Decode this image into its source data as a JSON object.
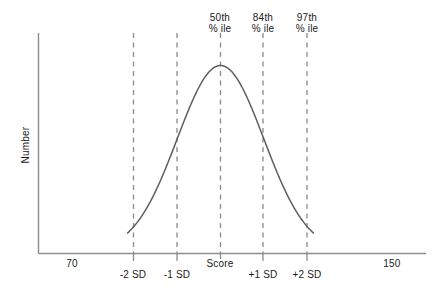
{
  "chart_data": {
    "type": "line",
    "title": "",
    "subtitle": "",
    "xlabel": "Score",
    "ylabel": "Number",
    "grid": false,
    "legend": null,
    "xlim": [
      70,
      150
    ],
    "ylim": [
      0,
      1
    ],
    "x_tick_labels": [
      "70",
      "150"
    ],
    "x_tick_values": [
      70,
      150
    ],
    "mean": 110,
    "sd": 20,
    "curve": {
      "name": "Normal distribution",
      "x": [
        70,
        74,
        78,
        82,
        86,
        90,
        94,
        98,
        102,
        106,
        110,
        114,
        118,
        122,
        126,
        130,
        134,
        138,
        142,
        146,
        150
      ],
      "y": [
        0.0111,
        0.0235,
        0.0458,
        0.0821,
        0.1353,
        0.2054,
        0.2865,
        0.3679,
        0.4868,
        0.6065,
        1.0,
        0.9231,
        0.8007,
        0.6376,
        0.4868,
        0.3247,
        0.2096,
        0.1353,
        0.0796,
        0.0388,
        0.0111
      ]
    },
    "reference_lines": [
      {
        "id": "minus-2-sd",
        "score": 90,
        "sd_label": "-2 SD",
        "percentile_label": null,
        "style": "dashed"
      },
      {
        "id": "minus-1-sd",
        "score": 100,
        "sd_label": "-1 SD",
        "percentile_label": null,
        "style": "dashed"
      },
      {
        "id": "mean",
        "score": 110,
        "sd_label": null,
        "percentile_label": {
          "line1": "50th",
          "line2": "% ile"
        },
        "style": "dashed"
      },
      {
        "id": "plus-1-sd",
        "score": 120,
        "sd_label": "+1 SD",
        "percentile_label": {
          "line1": "84th",
          "line2": "% ile"
        },
        "style": "dashed"
      },
      {
        "id": "plus-2-sd",
        "score": 130,
        "sd_label": "+2 SD",
        "percentile_label": {
          "line1": "97th",
          "line2": "% ile"
        },
        "style": "dashed"
      }
    ],
    "colors": {
      "curve": "#5a5a5a",
      "axis": "#888888",
      "dashed": "#8a8a8a",
      "text": "#1a1a1a",
      "background": "#ffffff"
    }
  },
  "axes": {
    "y_title": "Number",
    "x_title": "Score",
    "x_start_label": "70",
    "x_end_label": "150"
  },
  "annotations": {
    "percentiles": [
      {
        "line1": "50th",
        "line2": "% ile"
      },
      {
        "line1": "84th",
        "line2": "% ile"
      },
      {
        "line1": "97th",
        "line2": "% ile"
      }
    ],
    "sd_ticks": [
      "-2 SD",
      "-1 SD",
      "+1 SD",
      "+2 SD"
    ]
  }
}
